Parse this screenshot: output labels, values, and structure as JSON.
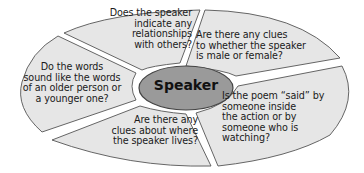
{
  "diagram": {
    "center_label": "Speaker",
    "segments": [
      {
        "id": "relationships",
        "text": "Does the speaker\nindicate any\nrelationships\nwith others?"
      },
      {
        "id": "gender",
        "text": "Are there any clues\nto whether the speaker\nis male or female?"
      },
      {
        "id": "action",
        "text": "Is the poem “said” by\nsomeone inside\nthe action or by\nsomeone who is\nwatching?"
      },
      {
        "id": "location",
        "text": "Are there any\nclues about where\nthe speaker lives?"
      },
      {
        "id": "age",
        "text": "Do the words\nsound like the words\nof an older person or\na younger one?"
      }
    ],
    "colors": {
      "segment_fill": "#e6e6e6",
      "segment_stroke": "#555555",
      "hub_fill": "#9a9a9a",
      "gap": "#ffffff"
    }
  }
}
